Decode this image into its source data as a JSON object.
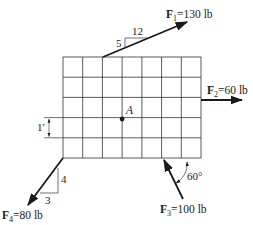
{
  "diagram": {
    "grid": {
      "columns": 7,
      "rows": 5,
      "cell_size_label": "1′"
    },
    "point": {
      "label": "A"
    },
    "forces": [
      {
        "id": "F1",
        "symbol": "F",
        "subscript": "1",
        "magnitude": "=130 lb",
        "slope": {
          "rise": "5",
          "run": "12"
        }
      },
      {
        "id": "F2",
        "symbol": "F",
        "subscript": "2",
        "magnitude": "=60 lb"
      },
      {
        "id": "F3",
        "symbol": "F",
        "subscript": "3",
        "magnitude": "=100 lb",
        "angle": "60°"
      },
      {
        "id": "F4",
        "symbol": "F",
        "subscript": "4",
        "magnitude": "=80 lb",
        "slope": {
          "rise": "4",
          "run": "3"
        }
      }
    ],
    "colors": {
      "line": "#1a1a1a",
      "grid": "#333333"
    }
  }
}
